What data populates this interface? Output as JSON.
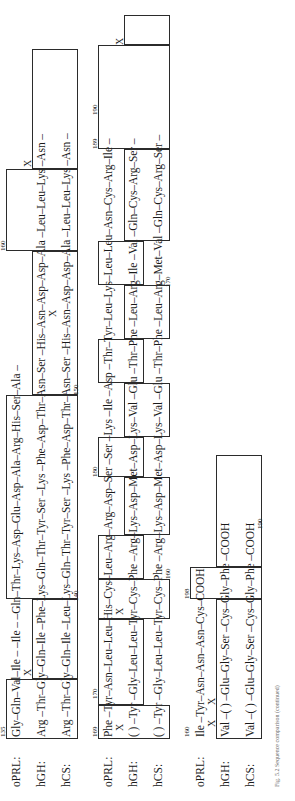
{
  "figure": {
    "type": "protein-sequence-alignment",
    "caption": "Fig. 5.2  Sequence comparison (continued)",
    "row_labels": [
      "oPRL:",
      "hGH:",
      "hCS:"
    ],
    "blocks": [
      {
        "id": "block-1",
        "number_ticks": [
          "135",
          "140",
          "150",
          "160"
        ],
        "rows": [
          {
            "label": "oPRL:",
            "sequence": "Gly–Gln–Val–Ile  –                 –Ile  –                           –Gln–Thr–Lys–Asp–Glu–Asp–Ala–Arg–His–Ser–Ala –",
            "x_marks": [
              "X",
              "X"
            ]
          },
          {
            "label": "hGH:",
            "sequence": "Arg –Thr–Gly–Gln–Ile –Phe–Lys–Gln–Thr–Tyr–Ser –Lys –Phe–Asp–Thr–Asn–Ser –His–Asn–Asp–Asp–Ala –Leu–Leu–Lys –Asn –",
            "x_marks": [
              "X"
            ]
          },
          {
            "label": "hCS:",
            "sequence": "Arg –Thr–Gly–Gln–Ile –Leu–Lys–Gln–Thr–Tyr–Ser –Lys –Phe–Asp–Thr–Asn–Ser –His–Asn–Asp–Asp–Ala –Leu–Leu–Lys –Asn –",
            "x_marks": []
          }
        ]
      },
      {
        "id": "block-2",
        "number_ticks": [
          "169",
          "170",
          "180",
          "189",
          "190",
          "160",
          "170"
        ],
        "rows": [
          {
            "label": "oPRL:",
            "sequence": "Phe  –Tyr–Asn–Leu–Leu–His–Cys–Leu–Arg–Arg–Asp–Ser –Ser –Lys –Ile  –Asp  –Thr–Tyr–Leu–Lys–Leu–Leu–Asn–Cys–Arg–Ile  –",
            "x_marks": [
              "X",
              "X",
              "X"
            ]
          },
          {
            "label": "hGH:",
            "sequence": "( )  –Tyr –Gly–Leu–Leu–Tyr–Cys–Phe –Arg–Lys–Asp–Met–Asp–Lys–Val –Glu –Thr–Phe –Leu–Arg–Ile –Val –Gln–Cys–Arg–Ser –",
            "x_marks": []
          },
          {
            "label": "hCS:",
            "sequence": "( )  –Tyr –Gly–Leu–Leu–Tyr–Cys–Phe –Arg–Lys–Asp–Met–Asp–Lys–Val –Glu –Thr–Phe –Leu–Arg–Met–Val –Gln–Cys–Arg–Ser –",
            "x_marks": []
          }
        ]
      },
      {
        "id": "block-3",
        "number_ticks": [
          "198",
          "190",
          "160",
          "180"
        ],
        "rows": [
          {
            "label": "oPRL:",
            "sequence": "Ile   –Tyr–Asn–Asn–Asn–Cys–COOH",
            "x_marks": [
              "X",
              "X"
            ]
          },
          {
            "label": "hGH:",
            "sequence": "Val  –( ) –Glu–Gly–Ser –Cys–Gly–Phe –COOH",
            "x_marks": []
          },
          {
            "label": "hCS:",
            "sequence": "Val  –( ) –Glu–Gly–Ser –Cys–Gly–Phe –COOH",
            "x_marks": []
          }
        ]
      }
    ]
  }
}
